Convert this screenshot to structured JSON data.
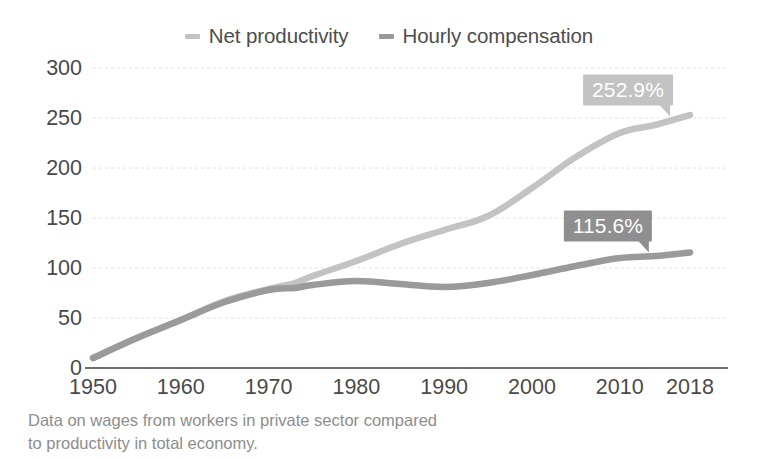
{
  "legend": {
    "position": "top-center",
    "entries": [
      {
        "label": "Net productivity",
        "color": "#c3c3c3",
        "marker": "dash-marker"
      },
      {
        "label": "Hourly compensation",
        "color": "#9a9a9a",
        "marker": "dash-marker"
      }
    ]
  },
  "footnote": {
    "line1": "Data on wages from workers in private sector compared",
    "line2": "to productivity in total economy."
  },
  "callouts": [
    {
      "text": "252.9%",
      "series": "Net productivity",
      "bg": "#c3c3c3",
      "x": 628,
      "y": 90
    },
    {
      "text": "115.6%",
      "series": "Hourly compensation",
      "bg": "#8f8f8f",
      "x": 608,
      "y": 226
    }
  ],
  "chart_data": {
    "type": "line",
    "title": "",
    "subtitle": "",
    "xlabel": "",
    "ylabel": "",
    "xlim": [
      1950,
      2018
    ],
    "ylim": [
      0,
      300
    ],
    "grid": true,
    "grid_color": "#e2e2e2",
    "axis_color": "#6f6f6f",
    "legend_position": "top-center",
    "x_tick_labels": [
      "1950",
      "1960",
      "1970",
      "1980",
      "1990",
      "2000",
      "2010",
      "2018"
    ],
    "x_ticks": [
      1950,
      1960,
      1970,
      1980,
      1990,
      2000,
      2010,
      2018
    ],
    "y_tick_labels": [
      "0",
      "50",
      "100",
      "150",
      "200",
      "250",
      "300"
    ],
    "y_ticks": [
      0,
      50,
      100,
      150,
      200,
      250,
      300
    ],
    "series": [
      {
        "name": "Net productivity",
        "color": "#c3c3c3",
        "end_label": "252.9%",
        "x": [
          1950,
          1955,
          1960,
          1965,
          1970,
          1973,
          1975,
          1980,
          1985,
          1990,
          1995,
          2000,
          2005,
          2010,
          2014,
          2018
        ],
        "values": [
          10,
          30,
          48,
          67,
          79,
          85,
          92,
          107,
          124,
          138,
          152,
          180,
          211,
          235,
          243,
          252.9
        ]
      },
      {
        "name": "Hourly compensation",
        "color": "#9a9a9a",
        "end_label": "115.6%",
        "x": [
          1950,
          1955,
          1960,
          1965,
          1970,
          1973,
          1975,
          1980,
          1985,
          1990,
          1995,
          2000,
          2005,
          2010,
          2014,
          2018
        ],
        "values": [
          10,
          30,
          48,
          66,
          78,
          80,
          83,
          87,
          84,
          81,
          85,
          93,
          102,
          110,
          112,
          115.6
        ]
      }
    ],
    "annotations": [
      {
        "text": "252.9%",
        "attached_to": "Net productivity",
        "at_x": 2018
      },
      {
        "text": "115.6%",
        "attached_to": "Hourly compensation",
        "at_x": 2018
      }
    ]
  }
}
